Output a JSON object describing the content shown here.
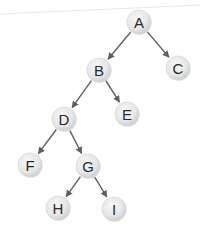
{
  "diagram": {
    "type": "binary-tree",
    "colors": {
      "background": "#ffffff",
      "page_edge": "#e6e6e6",
      "edge": "#5f5f5f",
      "node_fill_light": "#f4f4f4",
      "node_fill_dark": "#cfcfcf",
      "node_stroke": "#d8d8d8",
      "label": "#2a2a2a"
    },
    "node_radius": 12,
    "nodes": [
      {
        "id": "A",
        "label": "A",
        "x": 139,
        "y": 22
      },
      {
        "id": "B",
        "label": "B",
        "x": 99,
        "y": 70
      },
      {
        "id": "C",
        "label": "C",
        "x": 178,
        "y": 68
      },
      {
        "id": "D",
        "label": "D",
        "x": 64,
        "y": 119
      },
      {
        "id": "E",
        "label": "E",
        "x": 127,
        "y": 114
      },
      {
        "id": "F",
        "label": "F",
        "x": 30,
        "y": 165
      },
      {
        "id": "G",
        "label": "G",
        "x": 88,
        "y": 166
      },
      {
        "id": "H",
        "label": "H",
        "x": 58,
        "y": 208
      },
      {
        "id": "I",
        "label": "I",
        "x": 114,
        "y": 209
      }
    ],
    "edges": [
      {
        "from": "A",
        "to": "B"
      },
      {
        "from": "A",
        "to": "C"
      },
      {
        "from": "B",
        "to": "D"
      },
      {
        "from": "B",
        "to": "E"
      },
      {
        "from": "D",
        "to": "F"
      },
      {
        "from": "D",
        "to": "G"
      },
      {
        "from": "G",
        "to": "H"
      },
      {
        "from": "G",
        "to": "I"
      }
    ]
  }
}
